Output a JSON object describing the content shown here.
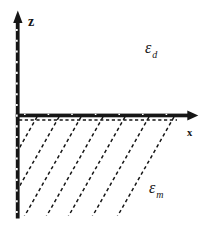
{
  "figure": {
    "background": "#ffffff",
    "ink_color": "#161616",
    "axes": {
      "vertical_label": "z",
      "horizontal_label": "x"
    },
    "regions": {
      "upper": {
        "symbol": "ε",
        "subscript": "d"
      },
      "lower": {
        "symbol": "ε",
        "subscript": "m"
      }
    }
  }
}
